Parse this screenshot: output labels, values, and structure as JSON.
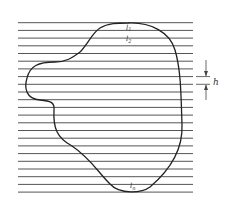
{
  "diagram": {
    "line_count": 23,
    "line_start_y": 22.7,
    "line_spacing": 7.7,
    "line_x_start": 18,
    "line_x_end": 193,
    "colors": {
      "lines": "#555555",
      "curve": "#222222",
      "text": "#333333"
    },
    "labels": {
      "l1": "l",
      "l1_sub": "1",
      "l2": "l",
      "l2_sub": "2",
      "ln": "l",
      "ln_sub": "n",
      "spacing": "h"
    }
  }
}
